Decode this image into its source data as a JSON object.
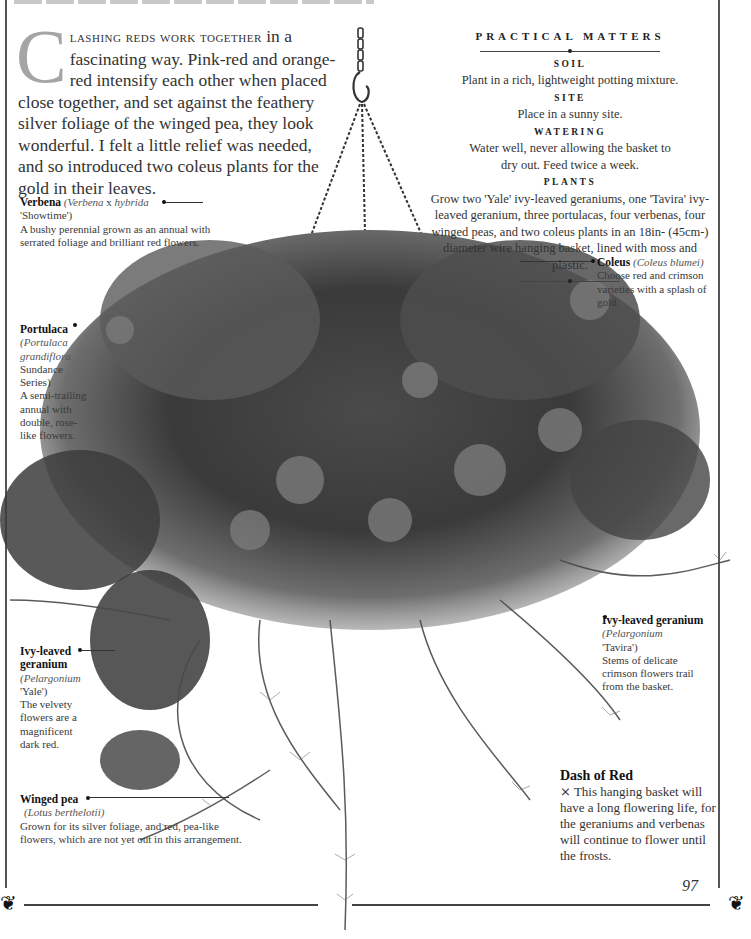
{
  "page": {
    "number": "97",
    "title_visible": "BASKET OF REDS (cropped)"
  },
  "intro": {
    "dropcap": "C",
    "lead_smallcaps": "lashing reds work together",
    "text": " in a fascinating way. Pink-red and orange-red intensify each other when placed close together, and set against the feathery silver foliage of the winged pea, they look wonderful. I felt a little relief was needed, and so introduced two coleus plants for the gold in their leaves."
  },
  "practical_matters": {
    "title": "PRACTICAL MATTERS",
    "sections": [
      {
        "heading": "SOIL",
        "text": "Plant in a rich, lightweight potting mixture."
      },
      {
        "heading": "SITE",
        "text": "Place in a sunny site."
      },
      {
        "heading": "WATERING",
        "text": "Water well, never allowing the basket to dry out. Feed twice a week."
      },
      {
        "heading": "PLANTS",
        "text": "Grow two 'Yale' ivy-leaved geraniums, one 'Tavira' ivy-leaved geranium, three portulacas, four verbenas, four winged peas, and two coleus plants in an 18in- (45cm-) diameter wire hanging basket, lined with moss and plastic."
      }
    ]
  },
  "captions": {
    "verbena": {
      "name": "Verbena",
      "latin": "(Verbena",
      "latin_x": "x",
      "latin2": "hybrida",
      "cultivar": "'Showtime')",
      "desc": "A bushy perennial grown as an annual with serrated foliage and brilliant red flowers."
    },
    "portulaca": {
      "name": "Portulaca",
      "latin": "(Portulaca grandiflora",
      "cultivar": "Sundance Series)",
      "desc": "A semi-trailing annual with double, rose-like flowers."
    },
    "coleus": {
      "name": "Coleus",
      "latin": "(Coleus blumei)",
      "desc": "Choose red and crimson varieties with a splash of gold."
    },
    "ivy_yale": {
      "name": "Ivy-leaved geranium",
      "latin": "(Pelargonium",
      "cultivar": "'Yale')",
      "desc": "The velvety flowers are a magnificent dark red."
    },
    "ivy_tavira": {
      "name": "Ivy-leaved geranium",
      "latin": "(Pelargonium",
      "cultivar": "'Tavira')",
      "desc": "Stems of delicate crimson flowers trail from the basket."
    },
    "winged_pea": {
      "name": "Winged pea",
      "latin": "(Lotus berthelotii)",
      "desc": "Grown for its silver foliage, and red, pea-like flowers, which are not yet out in this arrangement."
    }
  },
  "dash_of_red": {
    "title": "Dash of Red",
    "icon": "x-mark-glyph",
    "glyph": "⨯",
    "text": "This hanging basket will have a long flowering life, for the geraniums and verbenas will continue to flower until the frosts."
  },
  "ornaments": {
    "glyph": "❦"
  },
  "colors": {
    "text": "#333333",
    "dropcap": "#a5a5a5",
    "rule": "#444444",
    "foliage_dark": "#2b2b2b",
    "foliage_mid": "#6a6a6a",
    "foliage_light": "#9a9a9a"
  }
}
